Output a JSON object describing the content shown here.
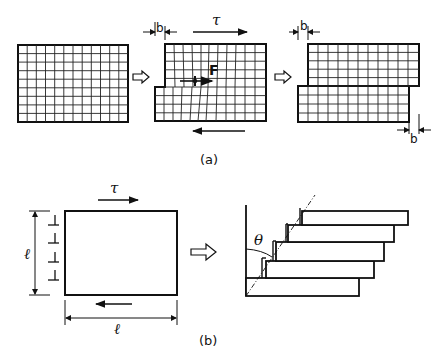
{
  "figure": {
    "panel_a": {
      "caption": "(a)",
      "stage1": {
        "description": "undeformed grid block"
      },
      "stage2": {
        "force_label": "F",
        "shear_label": "τ",
        "offset_label": "b"
      },
      "stage3": {
        "offset_top_label": "b",
        "offset_bottom_label": "b"
      }
    },
    "panel_b": {
      "caption": "(b)",
      "shear_label": "τ",
      "height_label": "ℓ",
      "width_label": "ℓ",
      "angle_label": "θ",
      "dislocation_count": 4,
      "plate_count": 5
    }
  },
  "colors": {
    "ink": "#111111",
    "background": "#ffffff"
  }
}
